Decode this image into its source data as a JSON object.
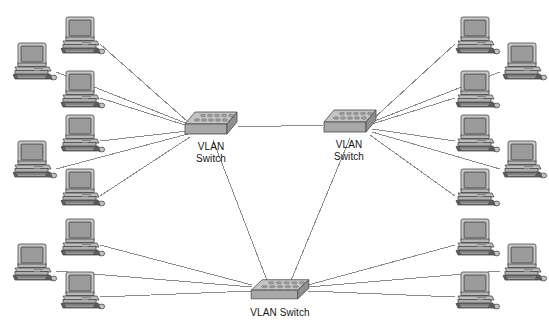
{
  "diagram": {
    "type": "network-topology",
    "background_color": "#ffffff",
    "link_color": "#8b8b8b",
    "device_fill": "#b3b3b3",
    "device_stroke": "#4a4a4a",
    "screen_color": "#8e8e8e",
    "label_color": "#161616",
    "label_font_size_px": 10
  },
  "switches": [
    {
      "id": "sw-left",
      "label_lines": [
        "VLAN",
        "Switch"
      ],
      "label_text": "VLAN Switch",
      "x": 183,
      "y": 110,
      "w": 56,
      "h": 30,
      "label_x": 182,
      "label_y": 141,
      "label_w": 58,
      "align": "center"
    },
    {
      "id": "sw-right",
      "label_lines": [
        "VLAN",
        "Switch"
      ],
      "label_text": "VLAN Switch",
      "x": 322,
      "y": 108,
      "w": 56,
      "h": 30,
      "label_x": 320,
      "label_y": 139,
      "label_w": 58,
      "align": "center"
    },
    {
      "id": "sw-bottom",
      "label_lines": [
        "VLAN Switch"
      ],
      "label_text": "VLAN Switch",
      "x": 249,
      "y": 278,
      "w": 62,
      "h": 26,
      "label_x": 240,
      "label_y": 307,
      "label_w": 80,
      "align": "center"
    }
  ],
  "workstations": [
    {
      "id": "pc-l1",
      "side": "left",
      "x": 60,
      "y": 14,
      "group": "left-top"
    },
    {
      "id": "pc-l2",
      "side": "left",
      "x": 12,
      "y": 40,
      "group": "left-top"
    },
    {
      "id": "pc-l3",
      "side": "left",
      "x": 60,
      "y": 68,
      "group": "left-top"
    },
    {
      "id": "pc-l4",
      "side": "left",
      "x": 60,
      "y": 112,
      "group": "left-mid"
    },
    {
      "id": "pc-l5",
      "side": "left",
      "x": 12,
      "y": 138,
      "group": "left-mid"
    },
    {
      "id": "pc-l6",
      "side": "left",
      "x": 60,
      "y": 166,
      "group": "left-mid"
    },
    {
      "id": "pc-l7",
      "side": "left",
      "x": 60,
      "y": 216,
      "group": "left-bottom"
    },
    {
      "id": "pc-l8",
      "side": "left",
      "x": 12,
      "y": 241,
      "group": "left-bottom"
    },
    {
      "id": "pc-l9",
      "side": "left",
      "x": 60,
      "y": 269,
      "group": "left-bottom"
    },
    {
      "id": "pc-r1",
      "side": "right",
      "x": 455,
      "y": 14,
      "group": "right-top"
    },
    {
      "id": "pc-r2",
      "side": "right",
      "x": 502,
      "y": 40,
      "group": "right-top"
    },
    {
      "id": "pc-r3",
      "side": "right",
      "x": 455,
      "y": 68,
      "group": "right-top"
    },
    {
      "id": "pc-r4",
      "side": "right",
      "x": 455,
      "y": 112,
      "group": "right-mid"
    },
    {
      "id": "pc-r5",
      "side": "right",
      "x": 502,
      "y": 138,
      "group": "right-mid"
    },
    {
      "id": "pc-r6",
      "side": "right",
      "x": 455,
      "y": 166,
      "group": "right-mid"
    },
    {
      "id": "pc-r7",
      "side": "right",
      "x": 455,
      "y": 216,
      "group": "right-bottom"
    },
    {
      "id": "pc-r8",
      "side": "right",
      "x": 502,
      "y": 241,
      "group": "right-bottom"
    },
    {
      "id": "pc-r9",
      "side": "right",
      "x": 455,
      "y": 269,
      "group": "right-bottom"
    }
  ],
  "links": [
    {
      "id": "trunk-left-right",
      "from": "sw-left",
      "to": "sw-right",
      "x1": 238,
      "y1": 127,
      "x2": 324,
      "y2": 125
    },
    {
      "id": "trunk-left-bottom",
      "from": "sw-left",
      "to": "sw-bottom",
      "x1": 213,
      "y1": 140,
      "x2": 268,
      "y2": 283
    },
    {
      "id": "trunk-right-bottom",
      "from": "sw-right",
      "to": "sw-bottom",
      "x1": 350,
      "y1": 138,
      "x2": 290,
      "y2": 283
    },
    {
      "id": "link-l1",
      "from": "pc-l1",
      "to": "sw-left",
      "x1": 100,
      "y1": 44,
      "x2": 188,
      "y2": 122
    },
    {
      "id": "link-l2",
      "from": "pc-l2",
      "to": "sw-left",
      "x1": 56,
      "y1": 72,
      "x2": 188,
      "y2": 124
    },
    {
      "id": "link-l3",
      "from": "pc-l3",
      "to": "sw-left",
      "x1": 100,
      "y1": 98,
      "x2": 188,
      "y2": 126
    },
    {
      "id": "link-l4",
      "from": "pc-l4",
      "to": "sw-left",
      "x1": 100,
      "y1": 141,
      "x2": 188,
      "y2": 131
    },
    {
      "id": "link-l5",
      "from": "pc-l5",
      "to": "sw-left",
      "x1": 56,
      "y1": 169,
      "x2": 188,
      "y2": 134
    },
    {
      "id": "link-l6",
      "from": "pc-l6",
      "to": "sw-left",
      "x1": 100,
      "y1": 196,
      "x2": 190,
      "y2": 137
    },
    {
      "id": "link-l7",
      "from": "pc-l7",
      "to": "sw-bottom",
      "x1": 100,
      "y1": 245,
      "x2": 252,
      "y2": 285
    },
    {
      "id": "link-l8",
      "from": "pc-l8",
      "to": "sw-bottom",
      "x1": 56,
      "y1": 271,
      "x2": 252,
      "y2": 287
    },
    {
      "id": "link-l9",
      "from": "pc-l9",
      "to": "sw-bottom",
      "x1": 100,
      "y1": 297,
      "x2": 252,
      "y2": 291
    },
    {
      "id": "link-r1",
      "from": "pc-r1",
      "to": "sw-right",
      "x1": 455,
      "y1": 44,
      "x2": 372,
      "y2": 120
    },
    {
      "id": "link-r2",
      "from": "pc-r2",
      "to": "sw-right",
      "x1": 500,
      "y1": 72,
      "x2": 372,
      "y2": 122
    },
    {
      "id": "link-r3",
      "from": "pc-r3",
      "to": "sw-right",
      "x1": 455,
      "y1": 98,
      "x2": 372,
      "y2": 124
    },
    {
      "id": "link-r4",
      "from": "pc-r4",
      "to": "sw-right",
      "x1": 455,
      "y1": 141,
      "x2": 372,
      "y2": 129
    },
    {
      "id": "link-r5",
      "from": "pc-r5",
      "to": "sw-right",
      "x1": 500,
      "y1": 169,
      "x2": 372,
      "y2": 132
    },
    {
      "id": "link-r6",
      "from": "pc-r6",
      "to": "sw-right",
      "x1": 455,
      "y1": 196,
      "x2": 370,
      "y2": 135
    },
    {
      "id": "link-r7",
      "from": "pc-r7",
      "to": "sw-bottom",
      "x1": 455,
      "y1": 245,
      "x2": 308,
      "y2": 285
    },
    {
      "id": "link-r8",
      "from": "pc-r8",
      "to": "sw-bottom",
      "x1": 500,
      "y1": 271,
      "x2": 308,
      "y2": 287
    },
    {
      "id": "link-r9",
      "from": "pc-r9",
      "to": "sw-bottom",
      "x1": 455,
      "y1": 297,
      "x2": 308,
      "y2": 291
    }
  ]
}
